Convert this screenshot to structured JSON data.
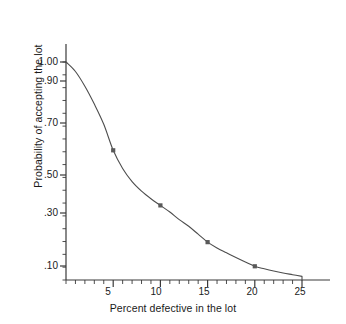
{
  "chart_data": {
    "type": "line",
    "title": "",
    "subtitle": "",
    "xlabel": "Percent defective in the lot",
    "ylabel": "Probability of accepting the lot",
    "xlim": [
      0,
      25
    ],
    "ylim": [
      0.05,
      1.0
    ],
    "grid": false,
    "legend": null,
    "x_ticks": [
      5,
      10,
      15,
      20,
      25
    ],
    "x_tick_labels": [
      "5",
      "10",
      "15",
      "20",
      "25"
    ],
    "x_minor_tick_step": 1,
    "y_ticks": [
      1.0,
      0.9,
      0.7,
      0.5,
      0.3,
      0.1
    ],
    "y_tick_labels": [
      "1.00",
      ".90",
      ".70",
      ".50",
      ".30",
      ".10"
    ],
    "y_scale": "probability",
    "series": [
      {
        "name": "Operating characteristic curve",
        "color": "#4d4d4d",
        "marker": "square",
        "marker_color": "#595959",
        "x": [
          0,
          1,
          2,
          3,
          4,
          5,
          6,
          7,
          8,
          9,
          10,
          11,
          12,
          13,
          14,
          15,
          16,
          17,
          18,
          19,
          20,
          21,
          22,
          23,
          24,
          25
        ],
        "y": [
          1.0,
          0.95,
          0.875,
          0.79,
          0.695,
          0.595,
          0.525,
          0.465,
          0.415,
          0.375,
          0.34,
          0.305,
          0.275,
          0.25,
          0.22,
          0.19,
          0.168,
          0.15,
          0.132,
          0.115,
          0.099,
          0.09,
          0.082,
          0.075,
          0.069,
          0.063
        ]
      }
    ],
    "marked_points": [
      {
        "x": 5,
        "y": 0.595
      },
      {
        "x": 10,
        "y": 0.34
      },
      {
        "x": 15,
        "y": 0.19
      },
      {
        "x": 20,
        "y": 0.099
      }
    ],
    "axis_color": "#3a3a3a",
    "line_color": "#4d4d4d",
    "background": "#ffffff"
  }
}
